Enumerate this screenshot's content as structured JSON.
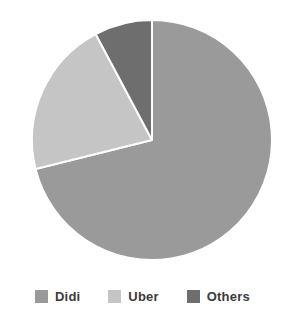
{
  "chart_data": {
    "type": "pie",
    "title": "",
    "subtitle": "",
    "categories": [
      "Didi",
      "Uber",
      "Others"
    ],
    "values": [
      71,
      21,
      8
    ],
    "unit": "%",
    "start_angle_deg": 0,
    "direction": "clockwise",
    "legend_position": "bottom",
    "grid": false,
    "slices": [
      {
        "label": "Didi",
        "value": 71,
        "color": "#9a9a9a",
        "start_angle_deg": 0,
        "end_angle_deg": 256
      },
      {
        "label": "Uber",
        "value": 21,
        "color": "#c5c5c5",
        "start_angle_deg": 256,
        "end_angle_deg": 332
      },
      {
        "label": "Others",
        "value": 8,
        "color": "#6e6e6e",
        "start_angle_deg": 332,
        "end_angle_deg": 360
      }
    ]
  },
  "figure": {
    "background_color": "#ffffff",
    "separator_color": "#ffffff",
    "center_x": 152,
    "center_y": 140,
    "radius": 120
  },
  "legend": {
    "items": [
      {
        "label": "Didi",
        "color": "#9a9a9a"
      },
      {
        "label": "Uber",
        "color": "#c5c5c5"
      },
      {
        "label": "Others",
        "color": "#6e6e6e"
      }
    ],
    "text_color": "#3b3b3b"
  }
}
